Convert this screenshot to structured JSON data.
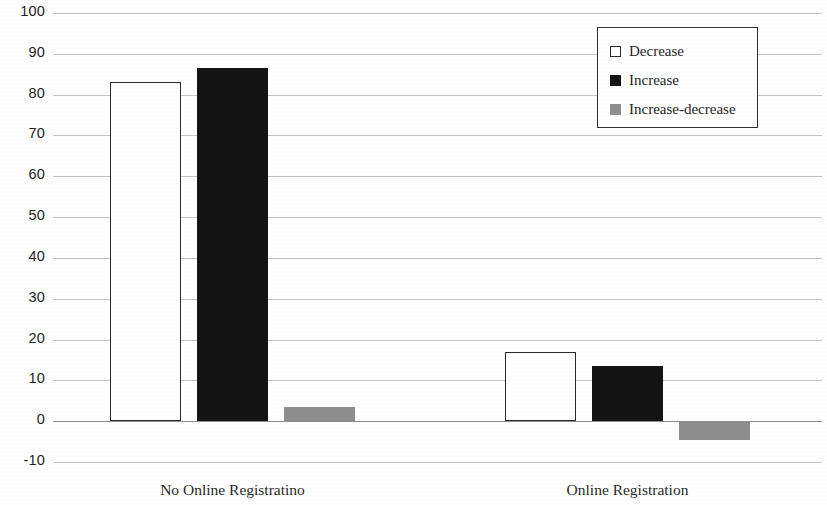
{
  "chart_data": {
    "type": "bar",
    "title": "",
    "subtitle": "",
    "xlabel": "",
    "ylabel": "",
    "categories": [
      "No Online Registratino",
      "Online Registration"
    ],
    "series": [
      {
        "name": "Decrease",
        "values": [
          83,
          17
        ],
        "color": "#ffffff",
        "border_color": "#2b2b2b"
      },
      {
        "name": "Increase",
        "values": [
          86.5,
          13.5
        ],
        "color": "#141414",
        "border_color": "#141414"
      },
      {
        "name": "Increase-decrease",
        "values": [
          3.5,
          -4.5
        ],
        "color": "#8e8e8e",
        "border_color": "#8e8e8e"
      }
    ],
    "ylim": [
      -10,
      100
    ],
    "ytick_step": 10,
    "yticks": [
      100,
      90,
      80,
      70,
      60,
      50,
      40,
      30,
      20,
      10,
      0,
      -10
    ],
    "grid": true,
    "grid_axis": "y",
    "legend_position": "top-right",
    "gridline_color": "#b9b9b9",
    "axis_color": "#8d8d8d",
    "background": "#ffffff"
  },
  "legend": {
    "items": [
      {
        "label": "Decrease",
        "swatch": "white-square-icon"
      },
      {
        "label": "Increase",
        "swatch": "black-square-icon"
      },
      {
        "label": "Increase-decrease",
        "swatch": "gray-square-icon"
      }
    ]
  }
}
